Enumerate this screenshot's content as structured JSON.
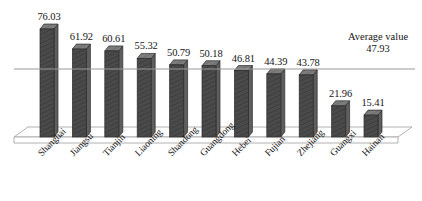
{
  "chart_data": {
    "type": "bar",
    "title": "",
    "subtitle": "",
    "xlabel": "",
    "ylabel": "",
    "grid": false,
    "legend_position": "none",
    "ylim": [
      0,
      80
    ],
    "categories": [
      "Shanghai",
      "Jiangsu",
      "Tianjin",
      "Liaoning",
      "Shandong",
      "Guangdong",
      "Hebei",
      "Fujian",
      "Zhejiang",
      "Guangxi",
      "Hainan"
    ],
    "values": [
      76.03,
      61.92,
      60.61,
      55.32,
      50.79,
      50.18,
      46.81,
      44.39,
      43.78,
      21.96,
      15.41
    ],
    "value_labels": [
      "76.03",
      "61.92",
      "60.61",
      "55.32",
      "50.79",
      "50.18",
      "46.81",
      "44.39",
      "43.78",
      "21.96",
      "15.41"
    ],
    "annotations": [
      {
        "name": "average-line",
        "label": "Average value",
        "value": 47.93,
        "value_label": "47.93",
        "type": "horizontal-reference-line"
      }
    ],
    "style": {
      "bar_front_color": "#4a4a4a",
      "bar_top_color": "#7d7d7d",
      "bar_side_color": "#5e5e5e",
      "bar_outline_color": "#2b2b2b",
      "average_line_color": "#9a9a9a",
      "floor_color": "#ffffff",
      "floor_outline_color": "#a8a8a8",
      "text_color": "#151515"
    }
  },
  "average_annotation": {
    "title": "Average value",
    "value": "47.93"
  }
}
